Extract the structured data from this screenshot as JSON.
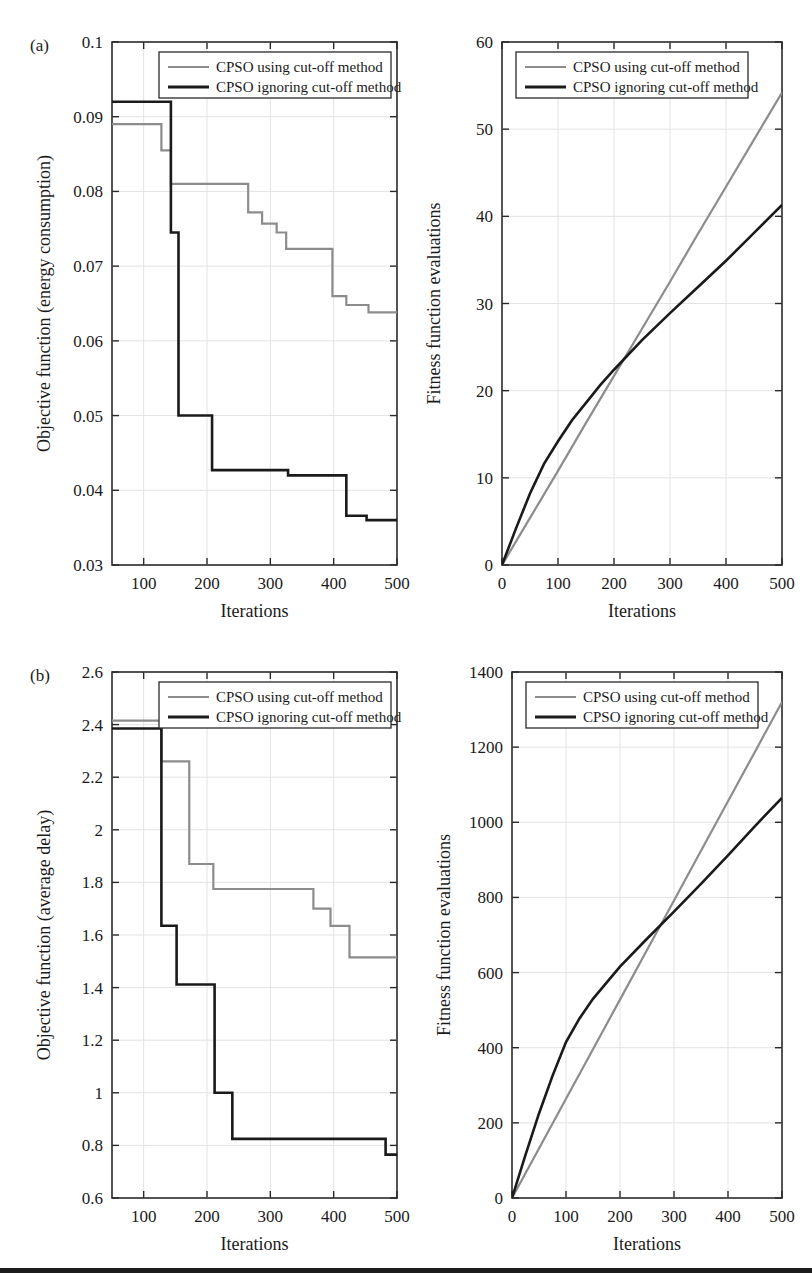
{
  "figure": {
    "panels": [
      {
        "tag": "(a)"
      },
      {
        "tag": "(b)"
      }
    ],
    "legend_entries": [
      {
        "label": "CPSO using cut-off method",
        "color": "#8c8c8c"
      },
      {
        "label": "CPSO ignoring cut-off method",
        "color": "#1a1a1a"
      }
    ],
    "bottom_rule_color": "#1c1c1c"
  },
  "chart_data": [
    {
      "id": "panel-a-left",
      "type": "line",
      "step": true,
      "title": "",
      "xlabel": "Iterations",
      "ylabel": "Objective function (energy consumption)",
      "xlim": [
        50,
        500
      ],
      "ylim": [
        0.03,
        0.1
      ],
      "xticks": [
        100,
        200,
        300,
        400,
        500
      ],
      "yticks": [
        0.03,
        0.04,
        0.05,
        0.06,
        0.07,
        0.08,
        0.09,
        0.1
      ],
      "ytick_labels": [
        "0.03",
        "0.04",
        "0.05",
        "0.06",
        "0.07",
        "0.08",
        "0.09",
        "0.1"
      ],
      "grid": true,
      "legend_position": "top-right",
      "series": [
        {
          "name": "CPSO using cut-off method",
          "color": "#8c8c8c",
          "x": [
            50,
            113,
            113,
            128,
            128,
            143,
            143,
            265,
            265,
            287,
            287,
            310,
            310,
            325,
            325,
            398,
            398,
            420,
            420,
            455,
            455,
            500
          ],
          "y": [
            0.089,
            0.089,
            0.089,
            0.089,
            0.0855,
            0.0855,
            0.081,
            0.081,
            0.0772,
            0.0772,
            0.0757,
            0.0757,
            0.0745,
            0.0745,
            0.0723,
            0.0723,
            0.066,
            0.066,
            0.0648,
            0.0648,
            0.0638,
            0.0638
          ]
        },
        {
          "name": "CPSO ignoring cut-off method",
          "color": "#1a1a1a",
          "x": [
            50,
            143,
            143,
            155,
            155,
            208,
            208,
            328,
            328,
            420,
            420,
            452,
            452,
            500
          ],
          "y": [
            0.092,
            0.092,
            0.0745,
            0.0745,
            0.05,
            0.05,
            0.0427,
            0.0427,
            0.042,
            0.042,
            0.0366,
            0.0366,
            0.036,
            0.036
          ]
        }
      ]
    },
    {
      "id": "panel-a-right",
      "type": "line",
      "step": false,
      "title": "",
      "xlabel": "Iterations",
      "ylabel": "Fitness function evaluations",
      "xlim": [
        0,
        500
      ],
      "ylim": [
        0,
        60
      ],
      "xticks": [
        0,
        100,
        200,
        300,
        400,
        500
      ],
      "yticks": [
        0,
        10,
        20,
        30,
        40,
        50,
        60
      ],
      "ytick_labels": [
        "0",
        "10",
        "20",
        "30",
        "40",
        "50",
        "60"
      ],
      "grid": true,
      "legend_position": "top-left",
      "series": [
        {
          "name": "CPSO using cut-off method",
          "color": "#8c8c8c",
          "x": [
            0,
            50,
            100,
            150,
            200,
            250,
            300,
            350,
            400,
            450,
            500
          ],
          "y": [
            0,
            5.4,
            10.8,
            16.3,
            21.7,
            27.1,
            32.5,
            38.0,
            43.4,
            48.8,
            54.2
          ]
        },
        {
          "name": "CPSO ignoring cut-off method",
          "color": "#1a1a1a",
          "x": [
            0,
            25,
            50,
            75,
            100,
            125,
            150,
            175,
            200,
            250,
            300,
            350,
            400,
            450,
            500
          ],
          "y": [
            0,
            4.2,
            8.2,
            11.6,
            14.2,
            16.6,
            18.6,
            20.6,
            22.4,
            25.8,
            28.9,
            31.9,
            34.9,
            38.1,
            41.3
          ]
        }
      ]
    },
    {
      "id": "panel-b-left",
      "type": "line",
      "step": true,
      "title": "",
      "xlabel": "Iterations",
      "ylabel": "Objective function (average delay)",
      "xlim": [
        50,
        500
      ],
      "ylim": [
        0.6,
        2.6
      ],
      "xticks": [
        100,
        200,
        300,
        400,
        500
      ],
      "yticks": [
        0.6,
        0.8,
        1.0,
        1.2,
        1.4,
        1.6,
        1.8,
        2.0,
        2.2,
        2.4,
        2.6
      ],
      "ytick_labels": [
        "0.6",
        "0.8",
        "1",
        "1.2",
        "1.4",
        "1.6",
        "1.8",
        "2",
        "2.2",
        "2.4",
        "2.6"
      ],
      "grid": true,
      "legend_position": "top-right",
      "series": [
        {
          "name": "CPSO using cut-off method",
          "color": "#8c8c8c",
          "x": [
            50,
            128,
            128,
            152,
            152,
            172,
            172,
            210,
            210,
            330,
            330,
            368,
            368,
            395,
            395,
            425,
            425,
            500
          ],
          "y": [
            2.415,
            2.415,
            2.26,
            2.26,
            2.26,
            2.26,
            1.87,
            1.87,
            1.775,
            1.775,
            1.775,
            1.775,
            1.7,
            1.7,
            1.635,
            1.635,
            1.515,
            1.515
          ]
        },
        {
          "name": "CPSO ignoring cut-off method",
          "color": "#1a1a1a",
          "x": [
            50,
            128,
            128,
            152,
            152,
            212,
            212,
            240,
            240,
            482,
            482,
            500
          ],
          "y": [
            2.385,
            2.385,
            1.635,
            1.635,
            1.412,
            1.412,
            1.0,
            1.0,
            0.825,
            0.825,
            0.765,
            0.765
          ]
        }
      ]
    },
    {
      "id": "panel-b-right",
      "type": "line",
      "step": false,
      "title": "",
      "xlabel": "Iterations",
      "ylabel": "Fitness function evaluations",
      "xlim": [
        0,
        500
      ],
      "ylim": [
        0,
        1400
      ],
      "xticks": [
        0,
        100,
        200,
        300,
        400,
        500
      ],
      "yticks": [
        0,
        200,
        400,
        600,
        800,
        1000,
        1200,
        1400
      ],
      "ytick_labels": [
        "0",
        "200",
        "400",
        "600",
        "800",
        "1000",
        "1200",
        "1400"
      ],
      "grid": true,
      "legend_position": "top-left",
      "series": [
        {
          "name": "CPSO using cut-off method",
          "color": "#8c8c8c",
          "x": [
            0,
            50,
            100,
            150,
            200,
            250,
            300,
            350,
            400,
            450,
            500
          ],
          "y": [
            0,
            132,
            264,
            396,
            528,
            660,
            792,
            924,
            1056,
            1188,
            1320
          ]
        },
        {
          "name": "CPSO ignoring cut-off method",
          "color": "#1a1a1a",
          "x": [
            0,
            25,
            50,
            75,
            100,
            125,
            150,
            200,
            250,
            300,
            350,
            400,
            450,
            500
          ],
          "y": [
            0,
            115,
            225,
            325,
            415,
            478,
            530,
            616,
            690,
            762,
            836,
            912,
            990,
            1065
          ]
        }
      ]
    }
  ]
}
